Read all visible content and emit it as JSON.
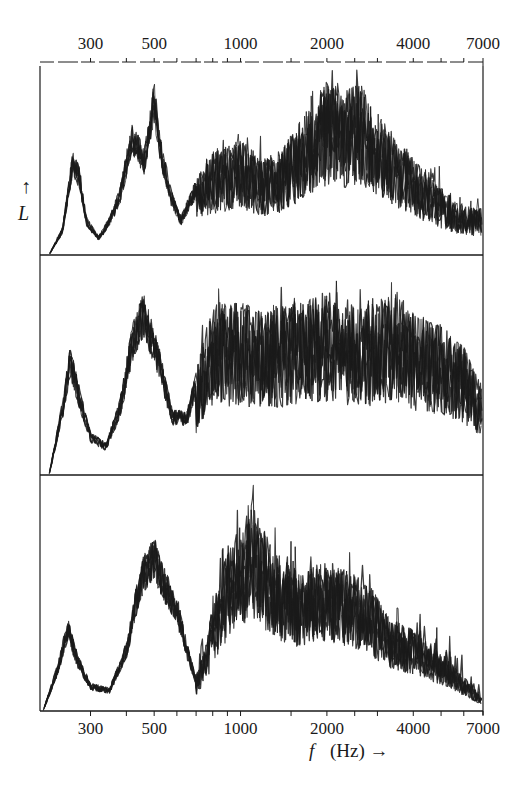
{
  "chart_data": {
    "type": "line",
    "title": "",
    "xlabel": "f (Hz) →",
    "xlabel_italic_part": "f",
    "xlabel_rest": "(Hz) →",
    "ylabel": "L",
    "ylabel_arrow": "↑",
    "xscale": "log",
    "xlim": [
      200,
      7000
    ],
    "x_ticks": [
      300,
      400,
      500,
      600,
      700,
      800,
      900,
      1000,
      1500,
      2000,
      2500,
      3000,
      4000,
      5000,
      6000,
      7000
    ],
    "x_tick_labels": [
      "300",
      "500",
      "1000",
      "2000",
      "4000",
      "7000"
    ],
    "x_tick_label_values": [
      300,
      500,
      1000,
      2000,
      4000,
      7000
    ],
    "top_axis_labels": [
      "300",
      "500",
      "1000",
      "2000",
      "4000",
      "7000"
    ],
    "grid": false,
    "legend": null,
    "panels": [
      {
        "name": "panel-top",
        "description": "overlaid spectra, dense; peaks near 270, 420, 520 Hz; broad hump 1800–3000 Hz",
        "envelope_freq": [
          215,
          240,
          260,
          275,
          290,
          320,
          350,
          380,
          420,
          460,
          500,
          530,
          570,
          620,
          680,
          760,
          850,
          1000,
          1200,
          1400,
          1700,
          2000,
          2300,
          2600,
          3000,
          3500,
          4000,
          5000,
          6000,
          7000
        ],
        "envelope_level": [
          0.0,
          0.15,
          0.55,
          0.45,
          0.2,
          0.1,
          0.2,
          0.35,
          0.7,
          0.55,
          0.9,
          0.6,
          0.35,
          0.2,
          0.35,
          0.5,
          0.55,
          0.6,
          0.5,
          0.55,
          0.75,
          0.9,
          0.85,
          0.9,
          0.75,
          0.6,
          0.5,
          0.35,
          0.25,
          0.25
        ],
        "density": 0.6
      },
      {
        "name": "panel-middle",
        "description": "overlaid spectra; peaks near 260 Hz and 450 Hz; flat dense plateau 800–7000 Hz",
        "envelope_freq": [
          215,
          240,
          255,
          275,
          300,
          340,
          380,
          420,
          460,
          520,
          580,
          650,
          720,
          800,
          1000,
          1200,
          1500,
          2000,
          2500,
          3000,
          3500,
          4000,
          5000,
          6000,
          7000
        ],
        "envelope_level": [
          0.0,
          0.35,
          0.6,
          0.4,
          0.2,
          0.15,
          0.35,
          0.7,
          0.85,
          0.6,
          0.3,
          0.3,
          0.55,
          0.8,
          0.8,
          0.75,
          0.8,
          0.85,
          0.8,
          0.8,
          0.85,
          0.75,
          0.7,
          0.6,
          0.4
        ],
        "density": 0.6
      },
      {
        "name": "panel-bottom",
        "description": "overlaid spectra; peak near 250 Hz; multiple peaks 400–600 Hz; strong peak near 1100 Hz; gradual decline to 7000 Hz",
        "envelope_freq": [
          205,
          230,
          250,
          270,
          300,
          350,
          400,
          450,
          500,
          550,
          600,
          650,
          700,
          760,
          850,
          950,
          1100,
          1300,
          1600,
          2000,
          2400,
          2800,
          3300,
          4000,
          5000,
          6000,
          7000
        ],
        "envelope_level": [
          0.0,
          0.2,
          0.4,
          0.25,
          0.12,
          0.1,
          0.3,
          0.65,
          0.75,
          0.6,
          0.5,
          0.3,
          0.15,
          0.3,
          0.6,
          0.75,
          0.9,
          0.7,
          0.6,
          0.65,
          0.6,
          0.55,
          0.4,
          0.35,
          0.25,
          0.15,
          0.05
        ],
        "density": 0.55
      }
    ],
    "colors": {
      "ink": "#1a1a1a",
      "background": "#ffffff"
    }
  },
  "layout": {
    "plot_left": 40,
    "plot_right": 483,
    "panel_tops": [
      56,
      255,
      475
    ],
    "panel_bottoms": [
      255,
      475,
      711
    ]
  }
}
